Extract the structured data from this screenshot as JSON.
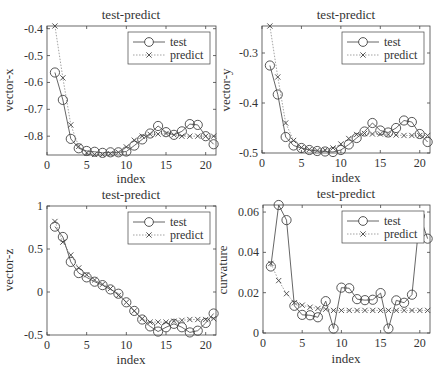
{
  "figure": {
    "colors": {
      "axis": "#444444",
      "test_line": "#555555",
      "predict_line": "#999999",
      "marker": "#444444",
      "background": "#ffffff"
    }
  },
  "chart_data": [
    {
      "type": "line",
      "title": "test-predict",
      "xlabel": "index",
      "ylabel": "vector-x",
      "xlim": [
        0,
        21.3
      ],
      "ylim": [
        -0.87,
        -0.39
      ],
      "xticks": [
        0,
        5,
        10,
        15,
        20
      ],
      "yticks": [
        -0.8,
        -0.7,
        -0.6,
        -0.5,
        -0.4
      ],
      "yticklabels": [
        "-0.8",
        "-0.7",
        "-0.6",
        "-0.5",
        "-0.4"
      ],
      "grid": false,
      "legend_position": "upper right",
      "x": [
        1,
        2,
        3,
        4,
        5,
        6,
        7,
        8,
        9,
        10,
        11,
        12,
        13,
        14,
        15,
        16,
        17,
        18,
        19,
        20,
        21
      ],
      "series": [
        {
          "name": "test",
          "style": "solid-circle",
          "values": [
            -0.563,
            -0.665,
            -0.81,
            -0.845,
            -0.855,
            -0.858,
            -0.862,
            -0.86,
            -0.86,
            -0.857,
            -0.835,
            -0.812,
            -0.79,
            -0.762,
            -0.785,
            -0.795,
            -0.782,
            -0.755,
            -0.758,
            -0.8,
            -0.83
          ]
        },
        {
          "name": "predict",
          "style": "dotted-x",
          "values": [
            -0.39,
            -0.583,
            -0.758,
            -0.838,
            -0.862,
            -0.868,
            -0.868,
            -0.865,
            -0.86,
            -0.84,
            -0.815,
            -0.8,
            -0.793,
            -0.792,
            -0.79,
            -0.795,
            -0.8,
            -0.8,
            -0.8,
            -0.8,
            -0.8
          ]
        }
      ]
    },
    {
      "type": "line",
      "title": "test-predict",
      "xlabel": "index",
      "ylabel": "vector-y",
      "xlim": [
        0,
        21.3
      ],
      "ylim": [
        -0.5,
        -0.246
      ],
      "xticks": [
        0,
        5,
        10,
        15,
        20
      ],
      "yticks": [
        -0.5,
        -0.4,
        -0.3
      ],
      "yticklabels": [
        "-0.5",
        "-0.4",
        "-0.3"
      ],
      "grid": false,
      "legend_position": "upper right",
      "x": [
        1,
        2,
        3,
        4,
        5,
        6,
        7,
        8,
        9,
        10,
        11,
        12,
        13,
        14,
        15,
        16,
        17,
        18,
        19,
        20,
        21
      ],
      "series": [
        {
          "name": "test",
          "style": "solid-circle",
          "values": [
            -0.325,
            -0.383,
            -0.468,
            -0.485,
            -0.49,
            -0.494,
            -0.496,
            -0.497,
            -0.498,
            -0.494,
            -0.483,
            -0.47,
            -0.457,
            -0.44,
            -0.455,
            -0.459,
            -0.45,
            -0.435,
            -0.438,
            -0.462,
            -0.478
          ]
        },
        {
          "name": "predict",
          "style": "dotted-x",
          "values": [
            -0.246,
            -0.348,
            -0.44,
            -0.475,
            -0.489,
            -0.493,
            -0.495,
            -0.494,
            -0.49,
            -0.482,
            -0.471,
            -0.463,
            -0.461,
            -0.462,
            -0.462,
            -0.463,
            -0.464,
            -0.465,
            -0.465,
            -0.465,
            -0.465
          ]
        }
      ]
    },
    {
      "type": "line",
      "title": "test-predict",
      "xlabel": "index",
      "ylabel": "vector-z",
      "xlim": [
        0,
        21.3
      ],
      "ylim": [
        -0.5,
        1.0
      ],
      "xticks": [
        0,
        5,
        10,
        15,
        20
      ],
      "yticks": [
        -0.5,
        0,
        0.5,
        1
      ],
      "yticklabels": [
        "-0.5",
        "0",
        "0.5",
        "1"
      ],
      "grid": false,
      "legend_position": "upper right",
      "x": [
        1,
        2,
        3,
        4,
        5,
        6,
        7,
        8,
        9,
        10,
        11,
        12,
        13,
        14,
        15,
        16,
        17,
        18,
        19,
        20,
        21
      ],
      "series": [
        {
          "name": "test",
          "style": "solid-circle",
          "values": [
            0.76,
            0.64,
            0.35,
            0.22,
            0.17,
            0.12,
            0.08,
            0.03,
            -0.02,
            -0.12,
            -0.22,
            -0.32,
            -0.4,
            -0.46,
            -0.41,
            -0.37,
            -0.41,
            -0.47,
            -0.45,
            -0.36,
            -0.25
          ]
        },
        {
          "name": "predict",
          "style": "dotted-x",
          "values": [
            0.82,
            0.58,
            0.43,
            0.28,
            0.2,
            0.14,
            0.09,
            0.04,
            -0.04,
            -0.12,
            -0.22,
            -0.31,
            -0.35,
            -0.35,
            -0.35,
            -0.34,
            -0.33,
            -0.32,
            -0.32,
            -0.32,
            -0.31
          ]
        }
      ]
    },
    {
      "type": "line",
      "title": "test-predict",
      "xlabel": "index",
      "ylabel": "curvature",
      "xlim": [
        0,
        21.3
      ],
      "ylim": [
        0,
        0.0635
      ],
      "xticks": [
        0,
        5,
        10,
        15,
        20
      ],
      "yticks": [
        0,
        0.02,
        0.04,
        0.06
      ],
      "yticklabels": [
        "0",
        "0.02",
        "0.04",
        "0.06"
      ],
      "grid": false,
      "legend_position": "upper right",
      "x": [
        1,
        2,
        3,
        4,
        5,
        6,
        7,
        8,
        9,
        10,
        11,
        12,
        13,
        14,
        15,
        16,
        17,
        18,
        19,
        20,
        21
      ],
      "series": [
        {
          "name": "test",
          "style": "solid-circle",
          "values": [
            0.033,
            0.0635,
            0.056,
            0.0135,
            0.009,
            0.0088,
            0.0078,
            0.0158,
            0.0022,
            0.0225,
            0.0222,
            0.0168,
            0.0163,
            0.0165,
            0.0198,
            0.0022,
            0.0162,
            0.015,
            0.019,
            0.058,
            0.0468
          ]
        },
        {
          "name": "predict",
          "style": "dotted-x",
          "values": [
            0.0345,
            0.026,
            0.0195,
            0.015,
            0.0138,
            0.0128,
            0.0122,
            0.0118,
            0.0112,
            0.0112,
            0.0112,
            0.0112,
            0.0112,
            0.0112,
            0.0112,
            0.0112,
            0.0112,
            0.0112,
            0.0112,
            0.0112,
            0.0112
          ]
        }
      ]
    }
  ],
  "legend": {
    "test_label": "test",
    "predict_label": "predict"
  }
}
